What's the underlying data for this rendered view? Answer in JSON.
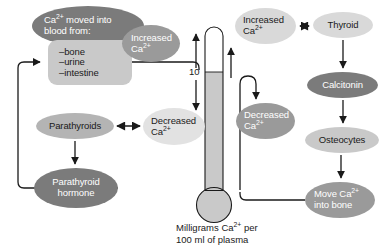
{
  "figure": {
    "caption_line1_pre": "Milligrams Ca",
    "caption_line1_sup": "2+",
    "caption_line1_post": " per",
    "caption_line2": "100 ml of plasma",
    "scale_tick": "10"
  },
  "nodes": {
    "ca_moved": {
      "line1_pre": "Ca",
      "line1_sup": "2+",
      "line1_post": " moved into",
      "line2": "blood from:",
      "fill": "#7b7b7b",
      "text": "#ffffff",
      "shape": "ellipse"
    },
    "sources": {
      "line1": "–bone",
      "line2": "–urine",
      "line3": "–intestine",
      "fill": "#c9c9c9",
      "text": "#1a1a1a",
      "shape": "rounded-rect"
    },
    "increased_ca_left": {
      "line1": "Increased",
      "line2_pre": "Ca",
      "line2_sup": "2+",
      "fill": "#9a9a9a",
      "text": "#ffffff",
      "shape": "ellipse"
    },
    "increased_ca_right": {
      "line1": "Increased",
      "line2_pre": "Ca",
      "line2_sup": "2+",
      "fill": "#d9d9d9",
      "text": "#1a1a1a",
      "shape": "ellipse"
    },
    "thyroid": {
      "label": "Thyroid",
      "fill": "#d9d9d9",
      "text": "#1a1a1a",
      "shape": "ellipse"
    },
    "calcitonin": {
      "label": "Calcitonin",
      "fill": "#7b7b7b",
      "text": "#ffffff",
      "shape": "ellipse"
    },
    "osteocytes": {
      "label": "Osteocytes",
      "fill": "#c9c9c9",
      "text": "#1a1a1a",
      "shape": "ellipse"
    },
    "move_ca_into_bone": {
      "line1_pre": "Move Ca",
      "line1_sup": "2+",
      "line2": "into bone",
      "fill": "#9a9a9a",
      "text": "#ffffff",
      "shape": "ellipse"
    },
    "decreased_ca_mid": {
      "line1": "Decreased",
      "line2_pre": "Ca",
      "line2_sup": "2+",
      "fill": "#9a9a9a",
      "text": "#ffffff",
      "shape": "ellipse"
    },
    "decreased_ca_left": {
      "line1": "Decreased",
      "line2_pre": "Ca",
      "line2_sup": "2+",
      "fill": "#e2e2e2",
      "text": "#1a1a1a",
      "shape": "ellipse"
    },
    "parathyroids": {
      "label": "Parathyroids",
      "fill": "#b4b4b4",
      "text": "#1a1a1a",
      "shape": "ellipse"
    },
    "parathyroid_hormone": {
      "line1": "Parathyroid",
      "line2": "hormone",
      "fill": "#7b7b7b",
      "text": "#ffffff",
      "shape": "ellipse"
    }
  },
  "thermometer": {
    "fill_color": "#c9c9c9",
    "outline_color": "#1a1a1a",
    "level_label": "10"
  },
  "colors": {
    "background": "#ffffff",
    "line": "#1a1a1a",
    "dark_fill": "#7b7b7b",
    "mid_fill": "#9a9a9a",
    "light_fill": "#c9c9c9",
    "xlight_fill": "#e2e2e2"
  }
}
